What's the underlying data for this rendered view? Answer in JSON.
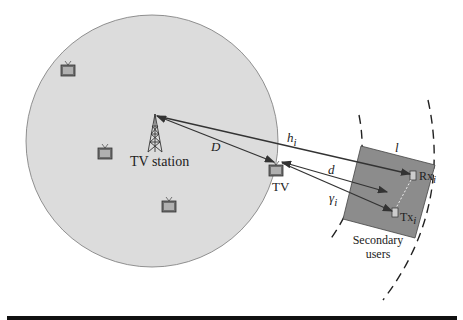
{
  "diagram": {
    "colors": {
      "coverage": "#dcdcdc",
      "square": "#8c8c8c",
      "line": "#333333"
    },
    "labels": {
      "tv_station": "TV station",
      "tv": "TV",
      "D": "D",
      "h_i": "h",
      "h_sub": "i",
      "d": "d",
      "gamma_i": "γ",
      "gamma_sub": "i",
      "l": "l",
      "rx": "Rx",
      "rx_sub": "i",
      "tx": "Tx",
      "tx_sub": "i",
      "secondary_users_line1": "Secondary",
      "secondary_users_line2": "users"
    },
    "nodes": [
      {
        "id": "tv-station",
        "type": "tower"
      },
      {
        "id": "tv-receiver",
        "type": "tv"
      },
      {
        "id": "tv-1",
        "type": "tv"
      },
      {
        "id": "tv-2",
        "type": "tv"
      },
      {
        "id": "tv-3",
        "type": "tv"
      },
      {
        "id": "rx",
        "type": "device"
      },
      {
        "id": "tx",
        "type": "device"
      }
    ],
    "edges": [
      {
        "from": "tv-station",
        "to": "tv-receiver",
        "label": "D"
      },
      {
        "from": "tv-station",
        "to": "rx",
        "label": "h_i"
      },
      {
        "from": "tv-receiver",
        "to": "secondary-center",
        "label": "d"
      },
      {
        "from": "tv-receiver",
        "to": "tx",
        "label": "gamma_i"
      },
      {
        "from": "tx",
        "to": "rx",
        "label": "N"
      }
    ]
  }
}
